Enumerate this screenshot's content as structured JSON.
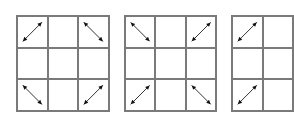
{
  "diagram": {
    "line_color": "#7a7a7a",
    "arrow_color": "#111111",
    "grids": [
      {
        "name": "grid-1",
        "left": 16,
        "width": 94,
        "height": 97,
        "cols": 3,
        "rows": 3,
        "arrows": [
          {
            "row": 0,
            "col": 0,
            "dir": "diag-up-right"
          },
          {
            "row": 0,
            "col": 2,
            "dir": "diag-down-right"
          },
          {
            "row": 2,
            "col": 0,
            "dir": "diag-down-right"
          },
          {
            "row": 2,
            "col": 2,
            "dir": "diag-up-right"
          }
        ]
      },
      {
        "name": "grid-2",
        "left": 124,
        "width": 93,
        "height": 97,
        "cols": 3,
        "rows": 3,
        "arrows": [
          {
            "row": 0,
            "col": 0,
            "dir": "diag-down-right"
          },
          {
            "row": 0,
            "col": 2,
            "dir": "diag-up-right"
          },
          {
            "row": 2,
            "col": 0,
            "dir": "diag-up-right"
          },
          {
            "row": 2,
            "col": 2,
            "dir": "diag-down-right"
          }
        ]
      },
      {
        "name": "grid-3",
        "left": 231,
        "width": 63,
        "height": 97,
        "cols": 2,
        "rows": 3,
        "arrows": [
          {
            "row": 0,
            "col": 0,
            "dir": "diag-up-right"
          },
          {
            "row": 2,
            "col": 0,
            "dir": "diag-up-right"
          }
        ]
      }
    ]
  }
}
